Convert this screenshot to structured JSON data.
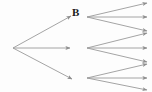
{
  "diagram": {
    "type": "game-tree",
    "canvas": {
      "width": 152,
      "height": 92
    },
    "background_color": "#fdfdfd",
    "edge_color": "#9a9a9a",
    "edge_width": 0.9,
    "arrowhead_color": "#8e8e8e",
    "label_color": "#1a1a1a",
    "labels": [
      {
        "id": "label-b",
        "text": "B",
        "x": 72,
        "y": 7,
        "font_size": 11,
        "style": "serif-bold"
      }
    ],
    "nodes": [
      {
        "id": "root",
        "role": "root",
        "x": 13,
        "y": 48
      },
      {
        "id": "n1",
        "role": "branch",
        "x": 87,
        "y": 17
      },
      {
        "id": "n2",
        "role": "branch",
        "x": 87,
        "y": 48
      },
      {
        "id": "n3",
        "role": "branch",
        "x": 87,
        "y": 78
      }
    ],
    "edges": [
      {
        "id": "e-root-1",
        "from": "root",
        "x1": 13,
        "y1": 48,
        "x2": 71,
        "y2": 16,
        "arrow": true
      },
      {
        "id": "e-root-2",
        "from": "root",
        "x1": 13,
        "y1": 48,
        "x2": 70,
        "y2": 48,
        "arrow": true
      },
      {
        "id": "e-root-3",
        "from": "root",
        "x1": 13,
        "y1": 48,
        "x2": 72,
        "y2": 79,
        "arrow": true
      },
      {
        "id": "e-n1-1",
        "from": "n1",
        "x1": 87,
        "y1": 17,
        "x2": 147,
        "y2": 3,
        "arrow": true
      },
      {
        "id": "e-n1-2",
        "from": "n1",
        "x1": 87,
        "y1": 17,
        "x2": 147,
        "y2": 17,
        "arrow": true
      },
      {
        "id": "e-n1-3",
        "from": "n1",
        "x1": 87,
        "y1": 17,
        "x2": 147,
        "y2": 31,
        "arrow": true
      },
      {
        "id": "e-n2-1",
        "from": "n2",
        "x1": 87,
        "y1": 48,
        "x2": 147,
        "y2": 33,
        "arrow": true
      },
      {
        "id": "e-n2-2",
        "from": "n2",
        "x1": 87,
        "y1": 48,
        "x2": 147,
        "y2": 48,
        "arrow": true
      },
      {
        "id": "e-n2-3",
        "from": "n2",
        "x1": 87,
        "y1": 48,
        "x2": 147,
        "y2": 62,
        "arrow": true
      },
      {
        "id": "e-n3-1",
        "from": "n3",
        "x1": 87,
        "y1": 78,
        "x2": 147,
        "y2": 64,
        "arrow": true
      },
      {
        "id": "e-n3-2",
        "from": "n3",
        "x1": 87,
        "y1": 78,
        "x2": 147,
        "y2": 78,
        "arrow": true
      },
      {
        "id": "e-n3-3",
        "from": "n3",
        "x1": 87,
        "y1": 78,
        "x2": 147,
        "y2": 90,
        "arrow": true
      }
    ]
  }
}
